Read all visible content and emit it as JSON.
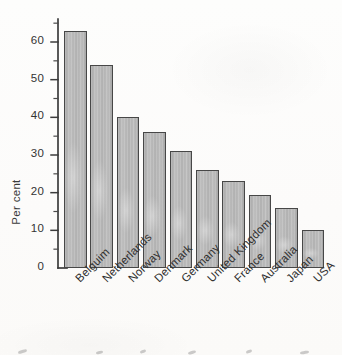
{
  "chart_data": {
    "type": "bar",
    "title": "",
    "subtitle": "",
    "xlabel": "",
    "ylabel": "Per cent",
    "categories": [
      "Belguim",
      "Netherlands",
      "Norway",
      "Denmark",
      "Germany",
      "United Kingdom",
      "France",
      "Australia",
      "Japan",
      "USA"
    ],
    "values": [
      63,
      54,
      40,
      36,
      31,
      26,
      23,
      19.5,
      16,
      10
    ],
    "ylim": [
      0,
      66
    ],
    "yticks": [
      0,
      10,
      20,
      30,
      40,
      50,
      60
    ],
    "ytick_labels": [
      "0",
      "10",
      "20",
      "30",
      "40",
      "50",
      "60"
    ],
    "minor_ticks": true,
    "minor_tick_step": 5,
    "grid": false,
    "legend": null,
    "legend_position": "none",
    "bar_fill_color": "#b4b4b4",
    "bar_edge_color": "#474747",
    "axis_color": "#3c3c3c",
    "background_color": "#fdfdfc",
    "annotations": []
  },
  "figure": {
    "name": "percent-bar-chart"
  }
}
